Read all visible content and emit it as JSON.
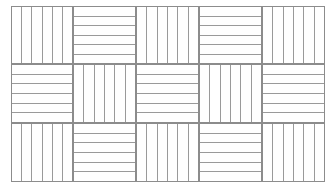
{
  "figure": {
    "background_color": "#ffffff",
    "line_color": "#9a9a9a",
    "border_color": "#8c8c8c",
    "canvas": {
      "width": 335,
      "height": 195
    },
    "frame": {
      "x": 11,
      "y": 6,
      "width": 314,
      "height": 176
    },
    "grid": {
      "columns": 5,
      "rows": 3,
      "column_edges": [
        11,
        73,
        136,
        199,
        262,
        325
      ],
      "row_edges": [
        6,
        64,
        123,
        182
      ]
    },
    "tile_defaults": {
      "stripes_per_tile": 6,
      "stripe_line_width": 1
    },
    "tiles": [
      {
        "name": "tile-r1-c1",
        "row": 1,
        "col": 1,
        "orientation": "vertical",
        "stripes": 6,
        "x": 11,
        "y": 6,
        "width": 62,
        "height": 58
      },
      {
        "name": "tile-r1-c2",
        "row": 1,
        "col": 2,
        "orientation": "horizontal",
        "stripes": 6,
        "x": 73,
        "y": 6,
        "width": 63,
        "height": 58
      },
      {
        "name": "tile-r1-c3",
        "row": 1,
        "col": 3,
        "orientation": "vertical",
        "stripes": 6,
        "x": 136,
        "y": 6,
        "width": 63,
        "height": 58
      },
      {
        "name": "tile-r1-c4",
        "row": 1,
        "col": 4,
        "orientation": "horizontal",
        "stripes": 6,
        "x": 199,
        "y": 6,
        "width": 63,
        "height": 58
      },
      {
        "name": "tile-r1-c5",
        "row": 1,
        "col": 5,
        "orientation": "vertical",
        "stripes": 6,
        "x": 262,
        "y": 6,
        "width": 63,
        "height": 58
      },
      {
        "name": "tile-r2-c1",
        "row": 2,
        "col": 1,
        "orientation": "horizontal",
        "stripes": 6,
        "x": 11,
        "y": 64,
        "width": 62,
        "height": 59
      },
      {
        "name": "tile-r2-c2",
        "row": 2,
        "col": 2,
        "orientation": "vertical",
        "stripes": 6,
        "x": 73,
        "y": 64,
        "width": 63,
        "height": 59
      },
      {
        "name": "tile-r2-c3",
        "row": 2,
        "col": 3,
        "orientation": "horizontal",
        "stripes": 6,
        "x": 136,
        "y": 64,
        "width": 63,
        "height": 59
      },
      {
        "name": "tile-r2-c4",
        "row": 2,
        "col": 4,
        "orientation": "vertical",
        "stripes": 6,
        "x": 199,
        "y": 64,
        "width": 63,
        "height": 59
      },
      {
        "name": "tile-r2-c5",
        "row": 2,
        "col": 5,
        "orientation": "horizontal",
        "stripes": 6,
        "x": 262,
        "y": 64,
        "width": 63,
        "height": 59
      },
      {
        "name": "tile-r3-c1",
        "row": 3,
        "col": 1,
        "orientation": "vertical",
        "stripes": 6,
        "x": 11,
        "y": 123,
        "width": 62,
        "height": 59
      },
      {
        "name": "tile-r3-c2",
        "row": 3,
        "col": 2,
        "orientation": "horizontal",
        "stripes": 6,
        "x": 73,
        "y": 123,
        "width": 63,
        "height": 59
      },
      {
        "name": "tile-r3-c3",
        "row": 3,
        "col": 3,
        "orientation": "vertical",
        "stripes": 6,
        "x": 136,
        "y": 123,
        "width": 63,
        "height": 59
      },
      {
        "name": "tile-r3-c4",
        "row": 3,
        "col": 4,
        "orientation": "horizontal",
        "stripes": 6,
        "x": 199,
        "y": 123,
        "width": 63,
        "height": 59
      },
      {
        "name": "tile-r3-c5",
        "row": 3,
        "col": 5,
        "orientation": "vertical",
        "stripes": 6,
        "x": 262,
        "y": 123,
        "width": 63,
        "height": 59
      }
    ]
  }
}
